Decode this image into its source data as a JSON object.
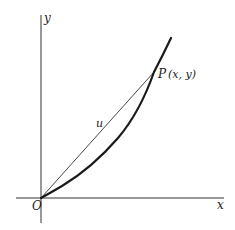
{
  "diagram": {
    "type": "coordinate-plot",
    "axes": {
      "x_label": "x",
      "y_label": "y",
      "origin_label": "O"
    },
    "curve": {
      "description": "convex increasing curve from origin through P",
      "stroke_color": "#1a1a1a"
    },
    "chord": {
      "label": "u",
      "from": "O",
      "to": "P",
      "stroke_color": "#333333"
    },
    "point": {
      "name": "P",
      "coords_label": "(x, y)"
    }
  }
}
